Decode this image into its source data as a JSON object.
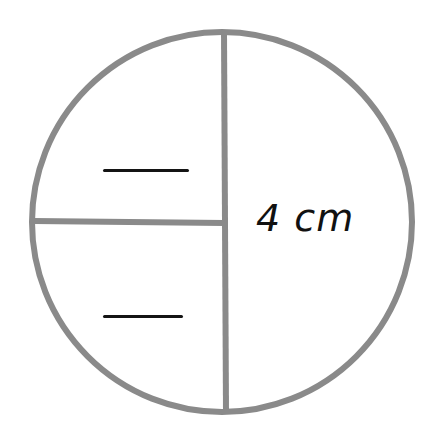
{
  "diagram": {
    "shape": "circle",
    "stroke_color": "#8a8a8a",
    "ink_color": "#141414",
    "circle": {
      "cx": 222,
      "cy": 222,
      "r": 190
    },
    "vertical_line": {
      "x": 224,
      "y1": 32,
      "y2": 412
    },
    "horizontal_line": {
      "y": 222,
      "x1": 34,
      "x2": 224
    },
    "labels": {
      "measurement": "4 cm"
    },
    "blanks": [
      {
        "region": "top-left quarter",
        "value": ""
      },
      {
        "region": "bottom-left quarter",
        "value": ""
      }
    ]
  }
}
